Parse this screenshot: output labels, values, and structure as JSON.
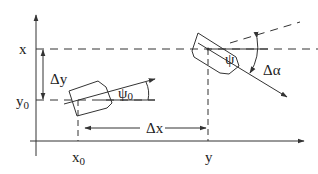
{
  "labels": {
    "x_axis_mark": "x",
    "y0_mark": "y",
    "y0_sub": "0",
    "delta_y": "Δy",
    "psi0": "ψ",
    "psi0_sub": "0",
    "delta_x": "Δx",
    "psi": "ψ",
    "delta_alpha": "Δα",
    "x0_mark": "x",
    "x0_sub": "0",
    "y_mark": "y"
  },
  "colors": {
    "stroke": "#333333",
    "text": "#222222"
  }
}
